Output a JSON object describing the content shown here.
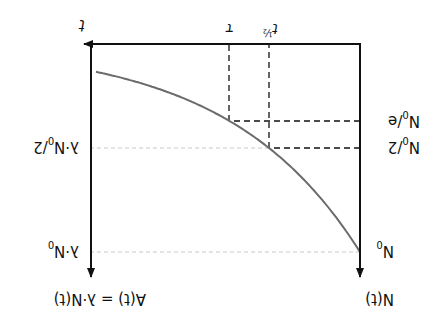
{
  "diagram": {
    "orientation": "rotated 180 degrees",
    "y_axis_left_label": "N(t)",
    "y_axis_right_label": "A(t) = λ·N(t)",
    "x_axis_label": "t",
    "left_ticks": {
      "n0": "N",
      "n0_sub": "0",
      "n0_half": "N",
      "n0_half_sub": "0",
      "n0_half_suffix": "/2",
      "n0_e": "N",
      "n0_e_sub": "0",
      "n0_e_suffix": "/e"
    },
    "right_ticks": {
      "lambda_n0": "λ·N",
      "lambda_n0_sub": "0",
      "lambda_n0_half": "λ·N",
      "lambda_n0_half_sub": "0",
      "lambda_n0_half_suffix": "/2"
    },
    "time_ticks": {
      "tau": "τ",
      "t_half": "t",
      "t_half_sub": "½"
    },
    "curve": {
      "description": "exponential decay N0·e^(-t/τ)",
      "color": "#6b6b6b"
    },
    "guide_color": "#c8c8c8",
    "axis_color": "#111111"
  }
}
